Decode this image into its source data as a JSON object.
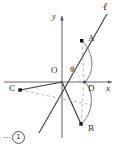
{
  "figure": {
    "figure_number": "1",
    "figure_number_leader": "⋯",
    "width": 120,
    "height": 150,
    "background_color": "#ffffff",
    "stroke_color": "#3a3a3a",
    "axis_color": "#555555",
    "dashed_color": "#999999",
    "point_color": "#111111"
  },
  "axes": {
    "origin_label": "O",
    "x_label": "x",
    "y_label": "y",
    "origin_px": {
      "x": 62,
      "y": 82
    },
    "x_axis": {
      "x1": 4,
      "y1": 82,
      "x2": 114,
      "y2": 82
    },
    "y_axis": {
      "x1": 62,
      "y1": 136,
      "x2": 62,
      "y2": 14
    }
  },
  "line_l": {
    "label": "ℓ",
    "label_pos": {
      "x": 103,
      "y": 4
    },
    "x1": 39,
    "y1": 133,
    "x2": 108,
    "y2": 13
  },
  "points": [
    {
      "name": "A",
      "label": "A",
      "x": 82,
      "y": 41,
      "label_x": 88,
      "label_y": 35
    },
    {
      "name": "B",
      "label": "B",
      "x": 81,
      "y": 124,
      "label_x": 88,
      "label_y": 124
    },
    {
      "name": "C",
      "label": "C",
      "x": 20,
      "y": 90,
      "label_x": 10,
      "label_y": 84
    },
    {
      "name": "D",
      "label": "D",
      "x": 84,
      "y": 82,
      "label_x": 88,
      "label_y": 84
    }
  ],
  "angle": {
    "label": "θ",
    "label_x": 71,
    "label_y": 68,
    "vertex": {
      "x": 62,
      "y": 82
    }
  },
  "segments": [
    {
      "name": "O-to-A-along-l",
      "style": "solid"
    },
    {
      "name": "O-to-B",
      "style": "solid"
    },
    {
      "name": "O-to-C",
      "style": "solid"
    },
    {
      "name": "A-to-D-vertical",
      "style": "dashed"
    },
    {
      "name": "D-to-B-vertical",
      "style": "dashed"
    },
    {
      "name": "C-through-origin-extended",
      "style": "dashed"
    },
    {
      "name": "arc-A-to-D",
      "style": "solid-arc"
    },
    {
      "name": "arc-D-to-B",
      "style": "solid-arc"
    },
    {
      "name": "angle-arc-theta",
      "style": "dashed-arc"
    }
  ]
}
